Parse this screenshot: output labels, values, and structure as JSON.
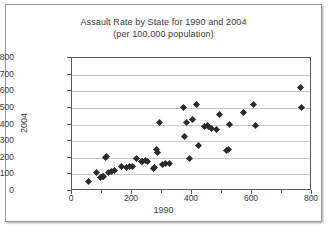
{
  "chart_data": {
    "type": "scatter",
    "title": "Assault Rate by State for 1990 and 2004",
    "subtitle": "(per 100,000 population)",
    "xlabel": "1990",
    "ylabel": "2004",
    "xlim": [
      0,
      800
    ],
    "ylim": [
      0,
      800
    ],
    "xticks": [
      0,
      200,
      400,
      600,
      800
    ],
    "xtick_labels": [
      "0",
      "200",
      "400",
      "600",
      "800"
    ],
    "xminor_ticks": [
      100,
      300,
      500,
      700
    ],
    "yticks": [
      0,
      100,
      200,
      300,
      400,
      500,
      600,
      700,
      800
    ],
    "ytick_labels": [
      "0",
      "100",
      "200",
      "300",
      "400",
      "500",
      "600",
      "700",
      "800"
    ],
    "grid": "horizontal",
    "legend": "none",
    "marker": "diamond",
    "marker_color": "#2b2b2b",
    "points": [
      [
        55,
        55
      ],
      [
        80,
        110
      ],
      [
        95,
        80
      ],
      [
        100,
        85
      ],
      [
        105,
        90
      ],
      [
        110,
        200
      ],
      [
        115,
        205
      ],
      [
        120,
        110
      ],
      [
        130,
        120
      ],
      [
        140,
        125
      ],
      [
        165,
        150
      ],
      [
        180,
        140
      ],
      [
        190,
        145
      ],
      [
        200,
        150
      ],
      [
        215,
        195
      ],
      [
        230,
        180
      ],
      [
        235,
        175
      ],
      [
        245,
        185
      ],
      [
        250,
        175
      ],
      [
        270,
        135
      ],
      [
        275,
        140
      ],
      [
        280,
        250
      ],
      [
        285,
        230
      ],
      [
        290,
        410
      ],
      [
        300,
        160
      ],
      [
        310,
        165
      ],
      [
        325,
        165
      ],
      [
        370,
        500
      ],
      [
        375,
        330
      ],
      [
        380,
        415
      ],
      [
        390,
        195
      ],
      [
        400,
        430
      ],
      [
        415,
        520
      ],
      [
        420,
        275
      ],
      [
        440,
        385
      ],
      [
        450,
        395
      ],
      [
        455,
        390
      ],
      [
        465,
        375
      ],
      [
        480,
        370
      ],
      [
        490,
        460
      ],
      [
        515,
        245
      ],
      [
        520,
        250
      ],
      [
        525,
        400
      ],
      [
        570,
        470
      ],
      [
        605,
        520
      ],
      [
        610,
        395
      ],
      [
        760,
        620
      ],
      [
        765,
        500
      ]
    ]
  }
}
